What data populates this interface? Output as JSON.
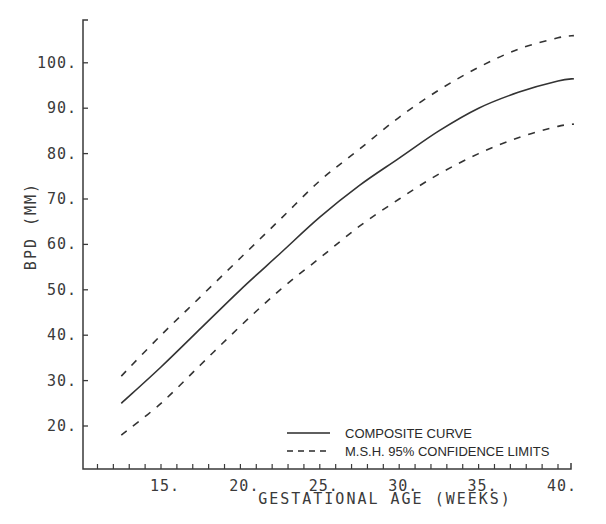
{
  "chart_data": {
    "type": "line",
    "title": "",
    "xlabel": "GESTATIONAL AGE (WEEKS)",
    "ylabel": "BPD (MM)",
    "xlim": [
      11,
      42
    ],
    "ylim": [
      11,
      108
    ],
    "grid": false,
    "legend_position": "lower right",
    "x_ticks": [
      15,
      20,
      25,
      30,
      35,
      40
    ],
    "x_tick_labels": [
      "15.",
      "20.",
      "25.",
      "30.",
      "35.",
      "40."
    ],
    "y_ticks": [
      20,
      30,
      40,
      50,
      60,
      70,
      80,
      90,
      100
    ],
    "y_tick_labels": [
      "20.",
      "30.",
      "40.",
      "50.",
      "60.",
      "70.",
      "80.",
      "90.",
      "100."
    ],
    "x": [
      12.5,
      15,
      17.5,
      20,
      22.5,
      25,
      27.5,
      30,
      32.5,
      35,
      37.5,
      40,
      41
    ],
    "series": [
      {
        "name": "COMPOSITE CURVE",
        "style": "solid",
        "values": [
          25,
          33,
          41.5,
          50,
          58,
          66,
          73,
          79,
          85,
          90,
          93.5,
          96,
          96.5
        ]
      },
      {
        "name": "M.S.H. 95% CONFIDENCE LIMITS (upper)",
        "style": "dashed",
        "values": [
          31,
          40,
          48.5,
          57,
          65.5,
          74,
          81,
          88,
          94,
          99,
          103,
          105.5,
          106
        ]
      },
      {
        "name": "M.S.H. 95% CONFIDENCE LIMITS (lower)",
        "style": "dashed",
        "values": [
          18,
          25,
          33.5,
          42,
          50,
          57,
          64,
          70,
          75.5,
          80,
          83.5,
          86,
          86.5
        ]
      }
    ],
    "legend": [
      {
        "label": "COMPOSITE CURVE",
        "style": "solid"
      },
      {
        "label": "M.S.H. 95% CONFIDENCE LIMITS",
        "style": "dashed"
      }
    ]
  },
  "colors": {
    "ink": "#3a3a3a",
    "background": "#ffffff"
  }
}
